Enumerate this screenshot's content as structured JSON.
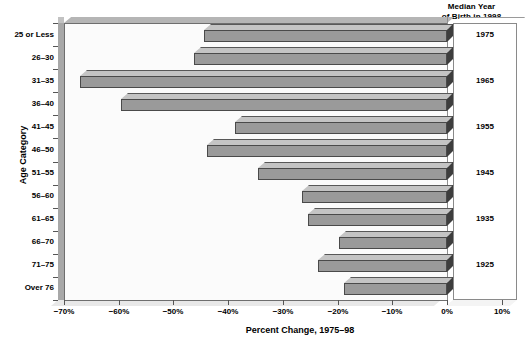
{
  "chart_data": {
    "type": "bar",
    "orientation": "horizontal",
    "title": "",
    "xlabel": "Percent Change, 1975–98",
    "ylabel": "Age Category",
    "xlim": [
      -70,
      10
    ],
    "xticks": [
      -70,
      -60,
      -50,
      -40,
      -30,
      -20,
      -10,
      0,
      10
    ],
    "xticklabels": [
      "−70%",
      "−60%",
      "−50%",
      "−40%",
      "−30%",
      "−20%",
      "−10%",
      "0%",
      "10%"
    ],
    "grid": false,
    "legend": null,
    "categories": [
      "25 or Less",
      "26–30",
      "31–35",
      "36–40",
      "41–45",
      "46–50",
      "51–55",
      "56–60",
      "61–65",
      "66–70",
      "71–75",
      "Over 76"
    ],
    "values": [
      -44.4,
      -46.2,
      -67.0,
      -59.6,
      -38.8,
      -43.9,
      -34.6,
      -26.5,
      -25.4,
      -19.8,
      -23.6,
      -18.9
    ],
    "annotations": {
      "right_panel_title": "Median Year\nof Birth in 1998",
      "right_panel_title_line1": "Median Year",
      "right_panel_title_line2": "of Birth in 1998",
      "median_years": [
        {
          "category_index": 0,
          "label": "1975"
        },
        {
          "category_index": 2,
          "label": "1965"
        },
        {
          "category_index": 4,
          "label": "1955"
        },
        {
          "category_index": 6,
          "label": "1945"
        },
        {
          "category_index": 8,
          "label": "1935"
        },
        {
          "category_index": 10,
          "label": "1925"
        }
      ]
    },
    "colors": {
      "bar_face": "#9a9a9a",
      "bar_top": "#c4c4c4",
      "bar_cap": "#3d3d3d",
      "bar_edge": "#4a4a4a",
      "plot_background": "#fbfbfb",
      "axis": "#6e6e6e",
      "text": "#000000"
    }
  }
}
